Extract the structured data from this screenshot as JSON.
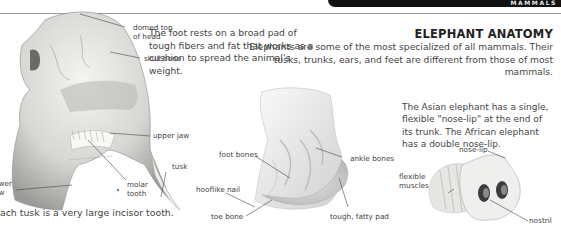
{
  "header": {
    "section_label": "MAMMALS"
  },
  "title": "ELEPHANT ANATOMY",
  "intro": "Elephants are some of the most specialized of all mammals. Their tusks, trunks, ears, and feet are different from those of most mammals.",
  "skull": {
    "caption": "Each tusk is a very large incisor tooth.",
    "labels": {
      "domed_top": "domed top of head",
      "skull_bone": "skull bone",
      "upper_jaw": "upper jaw",
      "tusk": "tusk",
      "lower_jaw": "lower jaw",
      "molar_tooth": "molar tooth"
    }
  },
  "foot": {
    "description": "The foot rests on a broad pad of tough fibers and fat that works as a cushion to spread the animal's weight.",
    "labels": {
      "foot_bones": "foot bones",
      "ankle_bones": "ankle bones",
      "hooflike_nail": "hooflike nail",
      "toe_bone": "toe bone",
      "fatty_pad": "tough, fatty pad"
    }
  },
  "trunk": {
    "description": "The Asian elephant has a single, flexible \"nose-lip\" at the end of its trunk. The African elephant has a double nose-lip.",
    "labels": {
      "nose_lip": "nose-lip",
      "flexible_muscles": "flexible muscles",
      "nostril": "nostril"
    }
  }
}
